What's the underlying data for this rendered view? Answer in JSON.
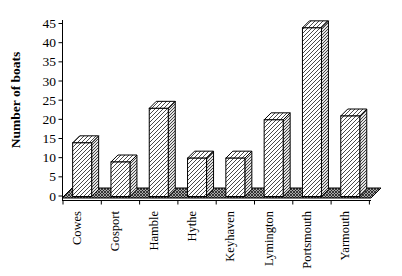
{
  "chart_data": {
    "type": "bar",
    "style": "3d-column-hatched",
    "title": "",
    "xlabel": "",
    "ylabel": "Number of boats",
    "categories": [
      "Cowes",
      "Gosport",
      "Hamble",
      "Hythe",
      "Keyhaven",
      "Lymington",
      "Portsmouth",
      "Yarmouth"
    ],
    "values": [
      14,
      9,
      23,
      10,
      10,
      20,
      44,
      21
    ],
    "yticks": [
      0,
      5,
      10,
      15,
      20,
      25,
      30,
      35,
      40,
      45
    ],
    "ylim": [
      0,
      45
    ],
    "grid": false,
    "legend": false,
    "colors": {
      "background": "#ffffff",
      "axis": "#000000",
      "text": "#000000",
      "bar_hatch": "#4a4a4a",
      "bar_face": "#ffffff",
      "bar_side": "#e2e2e2",
      "floor_base": "#a8a8a8",
      "floor_hatch": "#1a1a1a"
    }
  }
}
